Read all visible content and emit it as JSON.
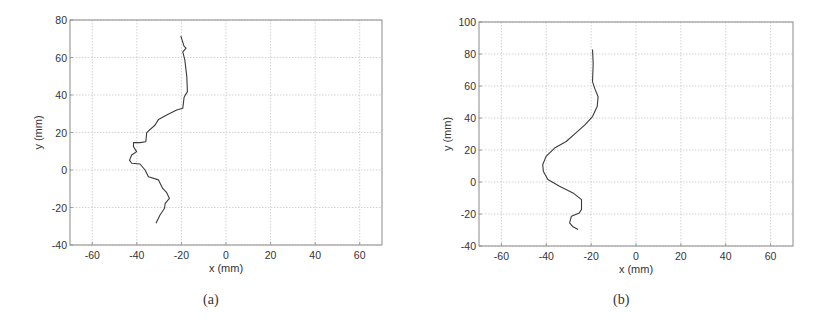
{
  "colors": {
    "frame": "#8a8a8a",
    "grid": "#c8c8c8",
    "curve": "#3a3a3a",
    "text": "#333333"
  },
  "chart_data": [
    {
      "id": "a",
      "type": "line",
      "caption": "(a)",
      "title": "",
      "xlabel": "x (mm)",
      "ylabel": "y (mm)",
      "xlim": [
        -70,
        70
      ],
      "ylim": [
        -40,
        80
      ],
      "xticks": [
        -60,
        -40,
        -20,
        0,
        20,
        40,
        60
      ],
      "yticks": [
        -40,
        -20,
        0,
        20,
        40,
        60,
        80
      ],
      "xtick_labels": [
        "-60",
        "-40",
        "-20",
        "0",
        "20",
        "40",
        "60"
      ],
      "ytick_labels": [
        "-40",
        "-20",
        "0",
        "20",
        "40",
        "60",
        "80"
      ],
      "grid": true,
      "frame_px": {
        "left": 70,
        "top": 20,
        "right": 382,
        "bottom": 245
      },
      "series": [
        {
          "name": "trajectory",
          "x": [
            -20.3,
            -18.8,
            -17.9,
            -19.4,
            -18.5,
            -17.6,
            -17.3,
            -18.8,
            -19.4,
            -22.1,
            -26.6,
            -30.3,
            -31.8,
            -35.6,
            -36.0,
            -38.6,
            -41.5,
            -41.5,
            -40.1,
            -42.3,
            -43.3,
            -42.3,
            -38.6,
            -36.3,
            -34.8,
            -30.3,
            -28.4,
            -26.6,
            -25.4,
            -27.3,
            -27.6,
            -29.6,
            -31.4
          ],
          "y": [
            71.6,
            66.0,
            65.0,
            63.0,
            58.7,
            49.8,
            41.8,
            38.8,
            32.9,
            32.0,
            29.3,
            27.0,
            24.0,
            19.9,
            15.1,
            14.6,
            14.6,
            12.4,
            9.8,
            8.0,
            5.3,
            3.6,
            3.2,
            0.0,
            -3.6,
            -5.3,
            -9.8,
            -12.1,
            -15.1,
            -17.8,
            -20.4,
            -24.0,
            -28.4
          ]
        }
      ]
    },
    {
      "id": "b",
      "type": "line",
      "caption": "(b)",
      "title": "",
      "xlabel": "x (mm)",
      "ylabel": "y (mm)",
      "xlim": [
        -70,
        70
      ],
      "ylim": [
        -40,
        100
      ],
      "xticks": [
        -60,
        -40,
        -20,
        0,
        20,
        40,
        60
      ],
      "yticks": [
        -40,
        -20,
        0,
        20,
        40,
        60,
        80,
        100
      ],
      "xtick_labels": [
        "-60",
        "-40",
        "-20",
        "0",
        "20",
        "40",
        "60"
      ],
      "ytick_labels": [
        "-40",
        "-20",
        "0",
        "20",
        "40",
        "60",
        "80",
        "100"
      ],
      "grid": true,
      "frame_px": {
        "left": 69,
        "top": 22,
        "right": 383,
        "bottom": 246
      },
      "series": [
        {
          "name": "trajectory",
          "x": [
            -19.4,
            -19.1,
            -19.4,
            -18.4,
            -16.9,
            -17.3,
            -19.4,
            -22.8,
            -27.3,
            -31.1,
            -36.3,
            -40.1,
            -41.6,
            -41.3,
            -39.3,
            -34.1,
            -28.1,
            -24.3,
            -24.3,
            -25.3,
            -28.8,
            -29.6,
            -28.1,
            -25.8
          ],
          "y": [
            82.8,
            74.0,
            62.7,
            58.5,
            53.3,
            47.1,
            40.9,
            35.7,
            30.1,
            25.3,
            21.2,
            16.0,
            10.8,
            6.6,
            1.5,
            -2.7,
            -6.8,
            -11.0,
            -17.2,
            -19.3,
            -21.4,
            -25.5,
            -28.0,
            -29.7
          ]
        }
      ]
    }
  ]
}
